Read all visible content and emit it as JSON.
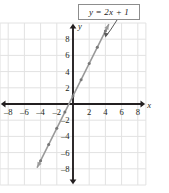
{
  "figure": {
    "label_box": {
      "text": "y = 2x + 1"
    },
    "axis_labels": {
      "x": "x",
      "y": "y"
    }
  },
  "chart_data": {
    "type": "line",
    "title": "",
    "equation": "y = 2x + 1",
    "xlabel": "x",
    "ylabel": "y",
    "xlim": [
      -9,
      9
    ],
    "ylim": [
      -10,
      10
    ],
    "grid": true,
    "grid_step": 2,
    "grid_color": "#e2e2e2",
    "axis_color": "#231f20",
    "line_color": "#9a9a9a",
    "x_ticks": [
      -8,
      -6,
      -4,
      -2,
      2,
      4,
      6,
      8
    ],
    "y_ticks": [
      -8,
      -6,
      -4,
      -2,
      2,
      4,
      6,
      8
    ],
    "x_tick_labels": [
      "–8",
      "–6",
      "–4",
      "–2",
      "2",
      "4",
      "6",
      "8"
    ],
    "y_tick_labels": [
      "–8",
      "–6",
      "–4",
      "–2",
      "2",
      "4",
      "6",
      "8"
    ],
    "series": [
      {
        "name": "y = 2x + 1",
        "slope": 2,
        "intercept": 1,
        "x_range": [
          -4.4,
          4.4
        ],
        "arrows": "both",
        "points": [
          {
            "x": -4,
            "y": -7
          },
          {
            "x": -3,
            "y": -5
          },
          {
            "x": -2,
            "y": -3
          },
          {
            "x": -1,
            "y": -1
          },
          {
            "x": 0,
            "y": 1
          },
          {
            "x": 1,
            "y": 3
          },
          {
            "x": 2,
            "y": 5
          },
          {
            "x": 3,
            "y": 7
          },
          {
            "x": 4,
            "y": 9
          }
        ]
      }
    ],
    "annotations": [
      {
        "text": "y = 2x + 1",
        "type": "callout-box",
        "points_to": {
          "x": 3.9,
          "y": 8.8
        }
      }
    ]
  }
}
